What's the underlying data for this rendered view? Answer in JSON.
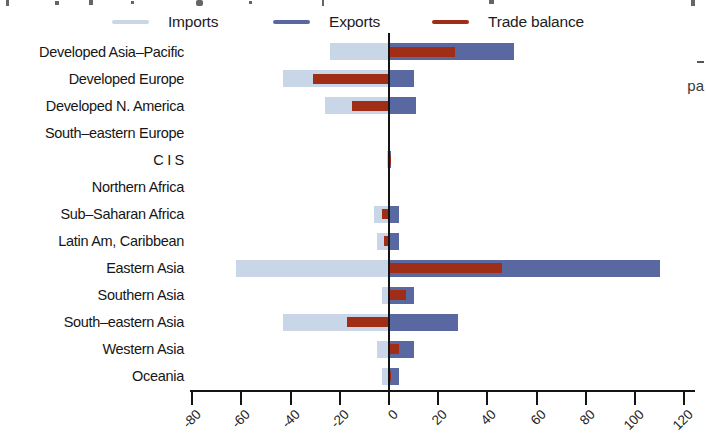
{
  "right_edge_fragment": "pa",
  "chart_data": {
    "type": "bar",
    "orientation": "horizontal",
    "title": "",
    "xlabel": "",
    "ylabel": "",
    "grid": false,
    "legend_position": "top",
    "xlim": [
      -81,
      125
    ],
    "xticks": [
      "-80",
      "-60",
      "-40",
      "-20",
      "0",
      "20",
      "40",
      "60",
      "80",
      "100",
      "120"
    ],
    "xtick_values": [
      -80,
      -60,
      -40,
      -20,
      0,
      20,
      40,
      60,
      80,
      100,
      120
    ],
    "categories": [
      "Developed Asia–Pacific",
      "Developed Europe",
      "Developed N. America",
      "South–eastern Europe",
      "C I S",
      "Northern Africa",
      "Sub–Saharan Africa",
      "Latin Am, Caribbean",
      "Eastern Asia",
      "Southern Asia",
      "South–eastern Asia",
      "Western Asia",
      "Oceania"
    ],
    "series": [
      {
        "name": "Imports",
        "color": "#c9d6e7",
        "values": [
          -24,
          -43,
          -26,
          0,
          -1,
          -0.5,
          -6,
          -5,
          -62,
          -3,
          -43,
          -5,
          -3
        ]
      },
      {
        "name": "Exports",
        "color": "#5a68a2",
        "values": [
          51,
          10,
          11,
          0,
          1,
          0.5,
          4,
          4,
          110,
          10,
          28,
          10,
          4
        ]
      },
      {
        "name": "Trade balance",
        "color": "#a02d15",
        "values": [
          27,
          -31,
          -15,
          0,
          1,
          0.5,
          -3,
          -2,
          46,
          7,
          -17,
          4,
          1
        ]
      }
    ],
    "axis_color": "#141414"
  }
}
